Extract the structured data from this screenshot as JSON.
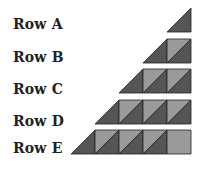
{
  "rows": [
    {
      "label": "Row A",
      "cells": [
        "tri"
      ]
    },
    {
      "label": "Row B",
      "cells": [
        "tri",
        "split"
      ]
    },
    {
      "label": "Row C",
      "cells": [
        "tri",
        "split",
        "split"
      ]
    },
    {
      "label": "Row D",
      "cells": [
        "tri",
        "split",
        "split",
        "split"
      ]
    },
    {
      "label": "Row E",
      "cells": [
        "tri",
        "split",
        "split",
        "split",
        "light"
      ]
    }
  ],
  "colors": {
    "dark": "#555555",
    "light": "#9a9a9a",
    "stroke": "#222222"
  }
}
